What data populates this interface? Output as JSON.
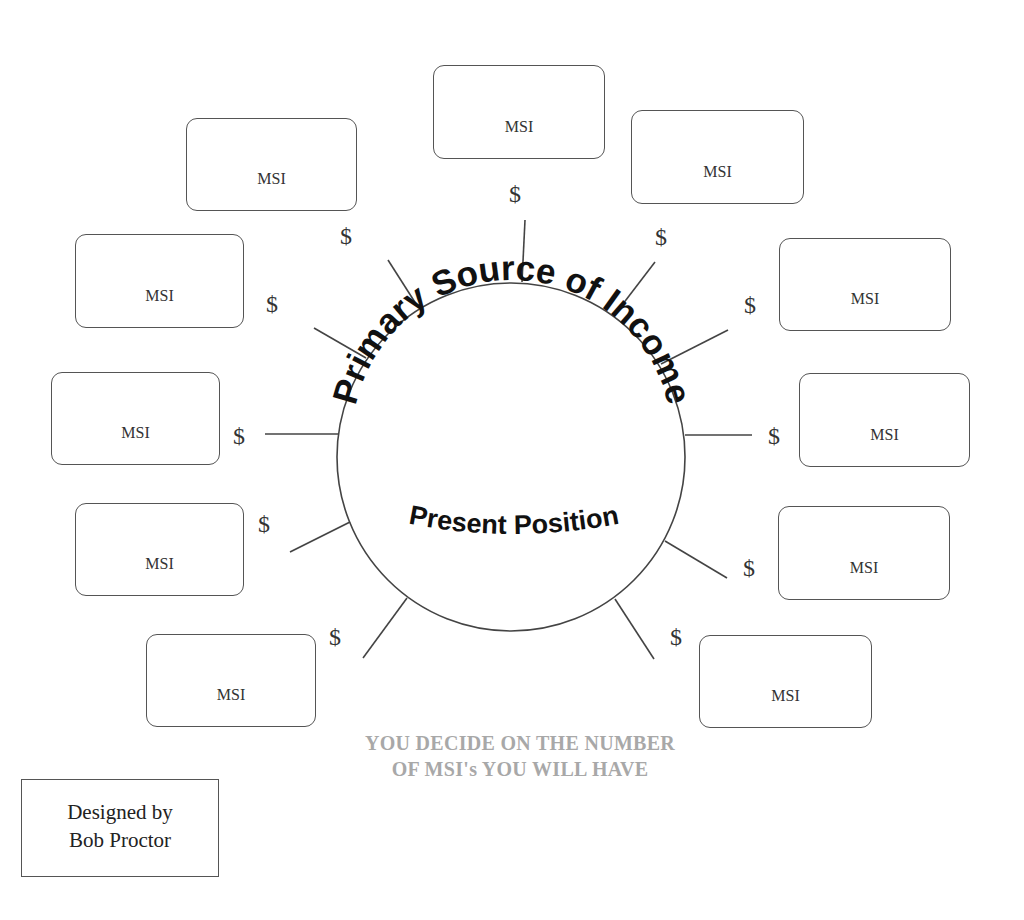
{
  "center": {
    "title": "Primary Source of Income",
    "subtitle": "Present Position"
  },
  "msi_boxes": [
    {
      "label": "MSI",
      "x": 433,
      "y": 65,
      "w": 172,
      "h": 94
    },
    {
      "label": "MSI",
      "x": 631,
      "y": 110,
      "w": 173,
      "h": 94
    },
    {
      "label": "MSI",
      "x": 779,
      "y": 238,
      "w": 172,
      "h": 93
    },
    {
      "label": "MSI",
      "x": 799,
      "y": 373,
      "w": 171,
      "h": 94
    },
    {
      "label": "MSI",
      "x": 778,
      "y": 506,
      "w": 172,
      "h": 94
    },
    {
      "label": "MSI",
      "x": 699,
      "y": 635,
      "w": 173,
      "h": 93
    },
    {
      "label": "MSI",
      "x": 146,
      "y": 634,
      "w": 170,
      "h": 93
    },
    {
      "label": "MSI",
      "x": 75,
      "y": 503,
      "w": 169,
      "h": 93
    },
    {
      "label": "MSI",
      "x": 51,
      "y": 372,
      "w": 169,
      "h": 93
    },
    {
      "label": "MSI",
      "x": 75,
      "y": 234,
      "w": 169,
      "h": 94
    },
    {
      "label": "MSI",
      "x": 186,
      "y": 118,
      "w": 171,
      "h": 93
    }
  ],
  "dollar_signs": [
    {
      "symbol": "$",
      "x": 509,
      "y": 182
    },
    {
      "symbol": "$",
      "x": 655,
      "y": 225
    },
    {
      "symbol": "$",
      "x": 744,
      "y": 293
    },
    {
      "symbol": "$",
      "x": 768,
      "y": 424
    },
    {
      "symbol": "$",
      "x": 743,
      "y": 556
    },
    {
      "symbol": "$",
      "x": 670,
      "y": 625
    },
    {
      "symbol": "$",
      "x": 329,
      "y": 625
    },
    {
      "symbol": "$",
      "x": 258,
      "y": 512
    },
    {
      "symbol": "$",
      "x": 233,
      "y": 424
    },
    {
      "symbol": "$",
      "x": 266,
      "y": 292
    },
    {
      "symbol": "$",
      "x": 340,
      "y": 224
    }
  ],
  "note": {
    "line1": "YOU DECIDE ON THE NUMBER",
    "line2": "OF MSI's YOU WILL HAVE"
  },
  "credit": {
    "line1": "Designed by",
    "line2": "Bob Proctor"
  }
}
